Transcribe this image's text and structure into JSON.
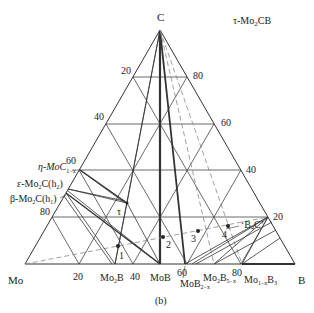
{
  "title": "τ-Mo2CB",
  "caption": "(b)",
  "vertices": {
    "top": "C",
    "left": "Mo",
    "right": "B"
  },
  "left_axis_ticks": [
    "20",
    "40",
    "60",
    "80"
  ],
  "right_axis_ticks": [
    "80",
    "60",
    "40",
    "20"
  ],
  "bottom_axis_ticks": [
    "20",
    "40",
    "60",
    "80"
  ],
  "phases": {
    "eta": "η-MoC",
    "eta_sub": "1−x",
    "epsilon": "ε-Mo",
    "epsilon_sub": "2",
    "epsilon_tail": "C(h",
    "epsilon_h": "2",
    "beta": "β-Mo",
    "beta_sub": "2",
    "beta_tail": "C(h",
    "beta_h": "1",
    "tau": "τ",
    "b4c": "‘B",
    "b4c_sub": "4",
    "b4c_tail": "C’",
    "mo2b": "Mo",
    "mo2b_sub": "2",
    "mo2b_tail": "B",
    "mob": "MoB",
    "mob2": "MoB",
    "mob2_sub": "2−x",
    "mo2b5": "Mo",
    "mo2b5_sub": "2",
    "mo2b5_mid": "B",
    "mo2b5_sub2": "5−x",
    "mo1b3": "Mo",
    "mo1b3_sub": "1−x",
    "mo1b3_tail": "B",
    "mo1b3_sub2": "3"
  },
  "sample_points": [
    "1",
    "2",
    "3",
    "4"
  ],
  "colors": {
    "line": "#333333",
    "dashed": "#888888",
    "background": "#ffffff"
  }
}
